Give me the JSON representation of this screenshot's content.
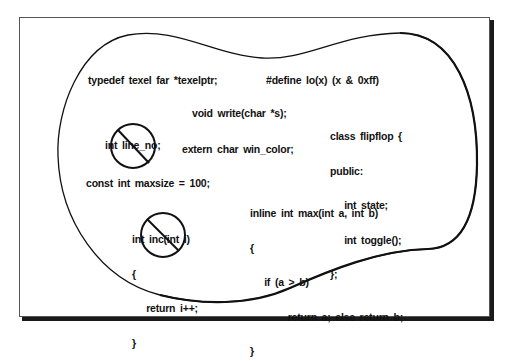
{
  "diagram": {
    "type": "scope-illustration",
    "colors": {
      "ink": "#111111",
      "background": "#ffffff",
      "frame_shadow": "#1a1a1a"
    },
    "items": {
      "typedef": "typedef texel far *texelptr;",
      "define": "#define lo(x) (x & 0xff)",
      "write_decl": "void write(char *s);",
      "class_block": {
        "lines": [
          "class flipflop {",
          "public:",
          "   int state;",
          "   int toggle();",
          "};"
        ]
      },
      "line_no": {
        "text": "int line_no;",
        "prohibited": true,
        "icon": "no-symbol-icon"
      },
      "extern_decl": "extern char win_color;",
      "const_decl": "const int maxsize = 100;",
      "inline_block": {
        "lines": [
          "inline int max(int a, int b)",
          "{",
          "   if (a > b)",
          "        return a; else return b;",
          "}"
        ]
      },
      "inc_block": {
        "lines": [
          "int inc(int i)",
          "{",
          "   return i++;",
          "}"
        ],
        "prohibited": true,
        "icon": "no-symbol-icon"
      }
    }
  }
}
